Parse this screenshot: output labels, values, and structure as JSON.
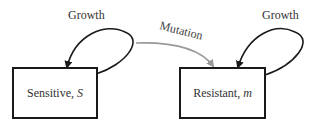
{
  "nodes": [
    {
      "id": "sensitive",
      "label": "Sensitive,",
      "variable": "S"
    },
    {
      "id": "resistant",
      "label": "Resistant,",
      "variable": "m"
    }
  ],
  "edges": [
    {
      "from": "sensitive",
      "to": "sensitive",
      "label": "Growth",
      "color": "#1a1a1a"
    },
    {
      "from": "sensitive",
      "to": "resistant",
      "label": "Mutation",
      "color": "#9a9a9a"
    },
    {
      "from": "resistant",
      "to": "resistant",
      "label": "Growth",
      "color": "#1a1a1a"
    }
  ]
}
